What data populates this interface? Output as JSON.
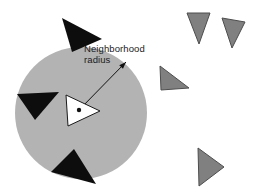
{
  "figure": {
    "kind": "schematic-diagram",
    "background_color": "#ffffff",
    "annotation": {
      "line1": "Neighborhood",
      "line2": "radius",
      "color": "#1a1a1a"
    }
  },
  "neighborhood_circle": {
    "label": "neighborhood region",
    "cx": 81,
    "cy": 113,
    "r": 66,
    "fill": "#b3b3b3"
  },
  "radius_arrow": {
    "label": "neighborhood radius arrow",
    "x1": 79,
    "y1": 110,
    "x2": 126,
    "y2": 62,
    "color": "#111111",
    "width": 1
  },
  "center_agent": {
    "label": "focal agent",
    "fill": "#ffffff",
    "stroke": "#1a1a1a",
    "points": "66,95 100,111 68,126",
    "dot": {
      "cx": 79,
      "cy": 110,
      "r": 2.2,
      "fill": "#111111"
    }
  },
  "neighbor_agents": {
    "fill": "#0d0d0d",
    "items": [
      {
        "name": "neighbor-agent-top",
        "points": "62,18 102,39 72,52"
      },
      {
        "name": "neighbor-agent-left",
        "points": "17,94 59,92 35,120"
      },
      {
        "name": "neighbor-agent-bottom",
        "points": "74,149 96,184 51,172"
      }
    ]
  },
  "outside_agents": {
    "fill": "#808080",
    "stroke": "#4d4d4d",
    "items": [
      {
        "name": "outside-agent-top-left",
        "points": "187,13 210,13 199,44"
      },
      {
        "name": "outside-agent-top-right",
        "points": "222,18 245,22 232,48"
      },
      {
        "name": "outside-agent-middle",
        "points": "160,66 189,88 161,90"
      },
      {
        "name": "outside-agent-bottom",
        "points": "198,148 224,167 199,186"
      }
    ]
  }
}
